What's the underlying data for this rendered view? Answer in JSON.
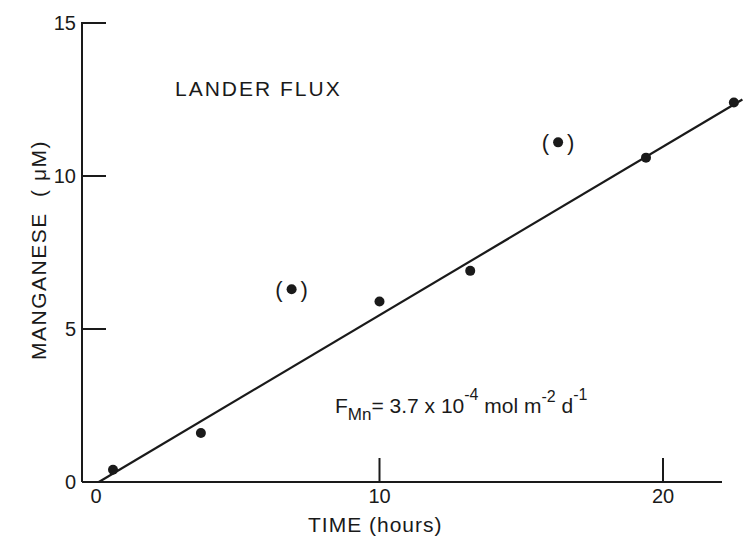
{
  "chart_data": {
    "type": "scatter",
    "title": "LANDER FLUX",
    "xlabel": "TIME (hours)",
    "ylabel": "MANGANESE (μM)",
    "xlim": [
      0,
      23
    ],
    "ylim": [
      0,
      15
    ],
    "xticks": [
      0,
      10,
      20
    ],
    "yticks": [
      0,
      5,
      10,
      15
    ],
    "xtick_labels": [
      "0",
      "10",
      "20"
    ],
    "ytick_labels": [
      "0",
      "5",
      "10",
      "15"
    ],
    "grid": false,
    "legend": null,
    "series": [
      {
        "name": "Mn measurements",
        "points": [
          {
            "x": 0.6,
            "y": 0.4
          },
          {
            "x": 3.7,
            "y": 1.6
          },
          {
            "x": 10.0,
            "y": 5.9
          },
          {
            "x": 13.2,
            "y": 6.9
          },
          {
            "x": 19.4,
            "y": 10.6
          },
          {
            "x": 22.5,
            "y": 12.4
          }
        ]
      },
      {
        "name": "Excluded points (bracketed)",
        "points": [
          {
            "x": 6.9,
            "y": 6.3
          },
          {
            "x": 16.3,
            "y": 11.1
          }
        ]
      }
    ],
    "fit_line": {
      "x": [
        0.1,
        22.8
      ],
      "y": [
        0.0,
        12.5
      ]
    },
    "annotations": [
      {
        "text": "F_Mn = 3.7 x 10^-4 mol m^-2 d^-1",
        "x": 10.5,
        "y": 2.7
      }
    ]
  },
  "labels": {
    "title": "LANDER FLUX",
    "xlabel": "TIME (hours)",
    "ylabel_main": "MANGANESE",
    "ylabel_unit": "( μM)",
    "flux_F": "F",
    "flux_sub": "Mn",
    "flux_eq": "= 3.7 x 10",
    "flux_exp1": "-4",
    "flux_mol": " mol  m",
    "flux_exp2": "-2",
    "flux_d": " d",
    "flux_exp3": "-1",
    "open_paren": "(",
    "close_paren": ")"
  },
  "colors": {
    "ink": "#1a1a1a",
    "background": "#ffffff"
  }
}
